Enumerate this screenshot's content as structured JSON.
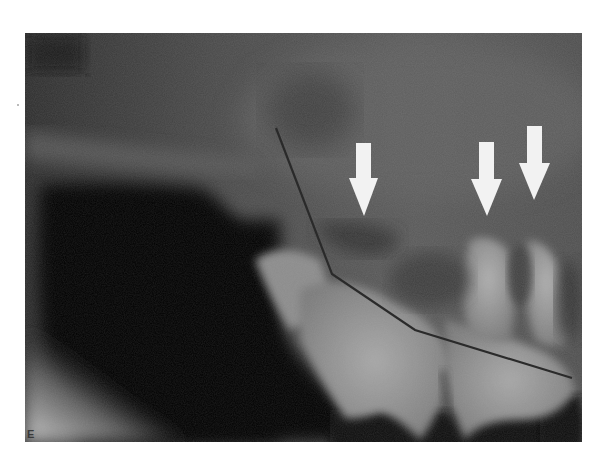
{
  "figure": {
    "panel_label": "E",
    "type": "dental radiograph",
    "annotations": {
      "arrows": [
        {
          "id": "arrow-1",
          "direction": "down",
          "tip_x": 364,
          "tip_y": 216,
          "color": "#f2f2f2"
        },
        {
          "id": "arrow-2",
          "direction": "down",
          "tip_x": 487,
          "tip_y": 216,
          "color": "#f2f2f2"
        },
        {
          "id": "arrow-3",
          "direction": "down",
          "tip_x": 534,
          "tip_y": 200,
          "color": "#f2f2f2"
        }
      ],
      "polyline": {
        "id": "reference-line",
        "color": "#2a2a2a",
        "points": [
          [
            276,
            128
          ],
          [
            332,
            274
          ],
          [
            415,
            330
          ],
          [
            572,
            378
          ]
        ]
      }
    }
  }
}
